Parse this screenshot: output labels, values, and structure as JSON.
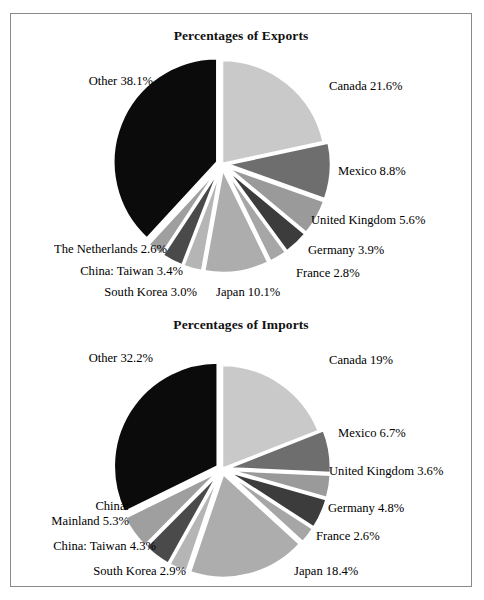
{
  "figure": {
    "background": "#ffffff",
    "frame_color": "#8a8a8a"
  },
  "charts": [
    {
      "id": "exports",
      "title": "Percentages of Exports"
    },
    {
      "id": "imports",
      "title": "Percentages of Imports"
    }
  ],
  "chart_data": [
    {
      "type": "pie",
      "title": "Percentages of Exports",
      "xlabel": "",
      "ylabel": "",
      "legend_position": "labels-around-pie",
      "grid": false,
      "start_angle_deg": -90,
      "direction": "clockwise",
      "exploded": true,
      "categories": [
        "Canada",
        "Mexico",
        "United Kingdom",
        "Germany",
        "France",
        "Japan",
        "South Korea",
        "China: Taiwan",
        "The Netherlands",
        "Other"
      ],
      "values": [
        21.6,
        8.8,
        5.6,
        3.9,
        2.8,
        10.1,
        3.0,
        3.4,
        2.6,
        38.1
      ],
      "labels": [
        "Canada 21.6%",
        "Mexico 8.8%",
        "United Kingdom 5.6%",
        "Germany 3.9%",
        "France 2.8%",
        "Japan 10.1%",
        "South Korea 3.0%",
        "China: Taiwan 3.4%",
        "The Netherlands 2.6%",
        "Other 38.1%"
      ],
      "colors": [
        "#c9c9c9",
        "#6e6e6e",
        "#9a9a9a",
        "#3c3c3c",
        "#a6a6a6",
        "#adadad",
        "#b5b5b5",
        "#4a4a4a",
        "#9f9f9f",
        "#0b0b0b"
      ]
    },
    {
      "type": "pie",
      "title": "Percentages of Imports",
      "xlabel": "",
      "ylabel": "",
      "legend_position": "labels-around-pie",
      "grid": false,
      "start_angle_deg": -90,
      "direction": "clockwise",
      "exploded": true,
      "categories": [
        "Canada",
        "Mexico",
        "United Kingdom",
        "Germany",
        "France",
        "Japan",
        "South Korea",
        "China: Taiwan",
        "China: Mainland",
        "Other"
      ],
      "values": [
        19.0,
        6.7,
        3.6,
        4.8,
        2.6,
        18.4,
        2.9,
        4.3,
        5.3,
        32.2
      ],
      "labels": [
        "Canada 19%",
        "Mexico 6.7%",
        "United Kingdom 3.6%",
        "Germany 4.8%",
        "France 2.6%",
        "Japan 18.4%",
        "South Korea 2.9%",
        "China: Taiwan 4.3%",
        "China:\nMainland 5.3%",
        "Other 32.2%"
      ],
      "colors": [
        "#c9c9c9",
        "#6e6e6e",
        "#9a9a9a",
        "#3c3c3c",
        "#a6a6a6",
        "#adadad",
        "#b5b5b5",
        "#4a4a4a",
        "#9f9f9f",
        "#0b0b0b"
      ]
    }
  ],
  "exports_labels": {
    "canada": "Canada 21.6%",
    "mexico": "Mexico 8.8%",
    "united_kingdom": "United Kingdom 5.6%",
    "germany": "Germany 3.9%",
    "france": "France 2.8%",
    "japan": "Japan 10.1%",
    "south_korea": "South Korea 3.0%",
    "china_taiwan": "China: Taiwan 3.4%",
    "netherlands": "The Netherlands 2.6%",
    "other": "Other 38.1%"
  },
  "imports_labels": {
    "canada": "Canada 19%",
    "mexico": "Mexico 6.7%",
    "united_kingdom": "United Kingdom 3.6%",
    "germany": "Germany 4.8%",
    "france": "France 2.6%",
    "japan": "Japan 18.4%",
    "south_korea": "South Korea 2.9%",
    "china_taiwan": "China: Taiwan 4.3%",
    "china_mainland_line1": "China:",
    "china_mainland_line2": "Mainland 5.3%",
    "other": "Other 32.2%"
  }
}
